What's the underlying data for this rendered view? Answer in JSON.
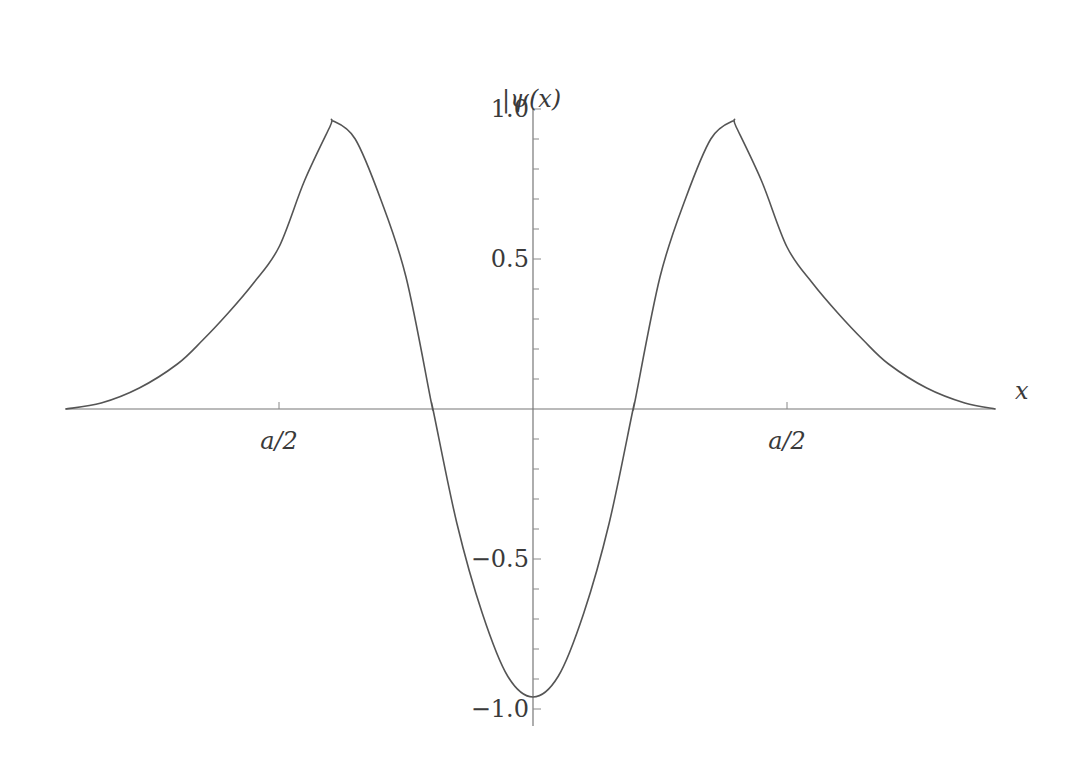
{
  "chart_data": {
    "type": "line",
    "title": "",
    "xlabel": "x",
    "ylabel": "|ψ(x)",
    "x_unit": "a/2",
    "xlim": [
      -1.84,
      1.82
    ],
    "ylim": [
      -1.05,
      1.0
    ],
    "grid": false,
    "legend": null,
    "x_ticks": [
      {
        "value": -1.0,
        "label": "a/2"
      },
      {
        "value": 1.0,
        "label": "a/2"
      }
    ],
    "y_ticks": [
      {
        "value": 1.0,
        "label": "1.0"
      },
      {
        "value": 0.5,
        "label": "0.5"
      },
      {
        "value": -0.5,
        "label": "−0.5"
      },
      {
        "value": -1.0,
        "label": "−1.0"
      }
    ],
    "y_minor_step": 0.1,
    "series": [
      {
        "name": "ψ(x)",
        "color": "#555555",
        "x": [
          -1.84,
          -1.7,
          -1.55,
          -1.4,
          -1.3,
          -1.2,
          -1.1,
          -1.0,
          -0.9,
          -0.8,
          -0.787,
          -0.7,
          -0.6,
          -0.5,
          -0.4,
          -0.394,
          -0.3,
          -0.2,
          -0.1,
          0.0,
          0.1,
          0.2,
          0.3,
          0.394,
          0.4,
          0.5,
          0.6,
          0.7,
          0.787,
          0.8,
          0.9,
          1.0,
          1.1,
          1.2,
          1.3,
          1.4,
          1.55,
          1.7,
          1.82
        ],
        "y": [
          0.0,
          0.02,
          0.07,
          0.15,
          0.23,
          0.32,
          0.42,
          0.54,
          0.76,
          0.94,
          0.96,
          0.9,
          0.7,
          0.44,
          0.02,
          0.0,
          -0.38,
          -0.68,
          -0.89,
          -0.96,
          -0.89,
          -0.68,
          -0.38,
          0.0,
          0.02,
          0.44,
          0.7,
          0.9,
          0.96,
          0.94,
          0.76,
          0.54,
          0.42,
          0.32,
          0.23,
          0.15,
          0.07,
          0.02,
          0.0
        ]
      }
    ]
  },
  "axes": {
    "x_label": "x",
    "y_label": "|ψ(x)"
  }
}
